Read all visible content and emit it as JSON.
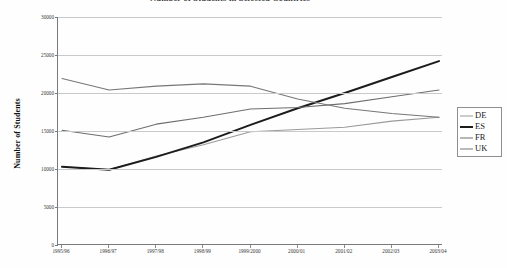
{
  "chart": {
    "title": "Number of Students in Selected Countries",
    "y_axis_title": "Number of Students",
    "x_axis_title": ""
  },
  "legend": {
    "position": "right",
    "items": [
      {
        "label": "DE",
        "color": "#9a9a9a",
        "width": 1.1
      },
      {
        "label": "ES",
        "color": "#1c1c1c",
        "width": 2.0
      },
      {
        "label": "FR",
        "color": "#6e6e6e",
        "width": 1.1
      },
      {
        "label": "UK",
        "color": "#777777",
        "width": 1.1
      }
    ]
  },
  "chart_data": {
    "type": "line",
    "title": "Number of Students in Selected Countries",
    "xlabel": "",
    "ylabel": "Number of Students",
    "ylim": [
      0,
      30000
    ],
    "yticks": [
      0,
      5000,
      10000,
      15000,
      20000,
      25000,
      30000
    ],
    "ytick_labels": [
      "0",
      "5000",
      "10000",
      "15000",
      "20000",
      "25000",
      "30000"
    ],
    "grid": true,
    "legend_position": "right",
    "categories": [
      "1995/96",
      "1996/97",
      "1997/98",
      "1998/99",
      "1999/2000",
      "2000/01",
      "2001/02",
      "2002/03",
      "2003/04"
    ],
    "series": [
      {
        "name": "DE",
        "color": "#9a9a9a",
        "values": [
          10300,
          9900,
          11700,
          13200,
          14900,
          15200,
          15500,
          16300,
          16800
        ]
      },
      {
        "name": "ES",
        "color": "#1c1c1c",
        "values": [
          10300,
          9900,
          11600,
          13500,
          15800,
          18000,
          20000,
          22100,
          24200
        ]
      },
      {
        "name": "FR",
        "color": "#6e6e6e",
        "values": [
          15100,
          14200,
          15900,
          16800,
          17900,
          18100,
          18600,
          19500,
          20400
        ]
      },
      {
        "name": "UK",
        "color": "#777777",
        "values": [
          21900,
          20400,
          20900,
          21200,
          20900,
          19200,
          18000,
          17300,
          16800
        ]
      }
    ]
  }
}
